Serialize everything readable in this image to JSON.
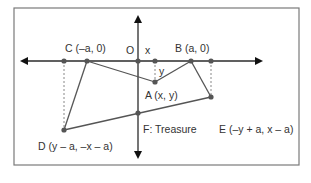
{
  "diagram": {
    "title": "",
    "colors": {
      "frame": "#7a7a7a",
      "axis": "#2b2b2b",
      "segment": "#555555",
      "point": "#555555",
      "dashed": "#888888",
      "text": "#333333"
    },
    "labels": {
      "origin": "O",
      "x_marker": "x",
      "y_marker": "y",
      "point_c": "C (–a, 0)",
      "point_b": "B (a, 0)",
      "point_a": "A (x, y)",
      "point_d": "D (y – a, –x – a)",
      "point_f": "F: Treasure",
      "point_e": "E (–y + a, x – a)"
    },
    "points": [
      {
        "name": "C",
        "coords": "(-a, 0)"
      },
      {
        "name": "O",
        "coords": "origin"
      },
      {
        "name": "B",
        "coords": "(a, 0)"
      },
      {
        "name": "A",
        "coords": "(x, y)"
      },
      {
        "name": "D",
        "coords": "(y - a, -x - a)"
      },
      {
        "name": "E",
        "coords": "(-y + a, x - a)"
      },
      {
        "name": "F",
        "coords": "Treasure"
      }
    ],
    "segments": [
      [
        "C",
        "A"
      ],
      [
        "A",
        "B"
      ],
      [
        "C",
        "D"
      ],
      [
        "D",
        "E"
      ],
      [
        "B",
        "E"
      ]
    ]
  }
}
